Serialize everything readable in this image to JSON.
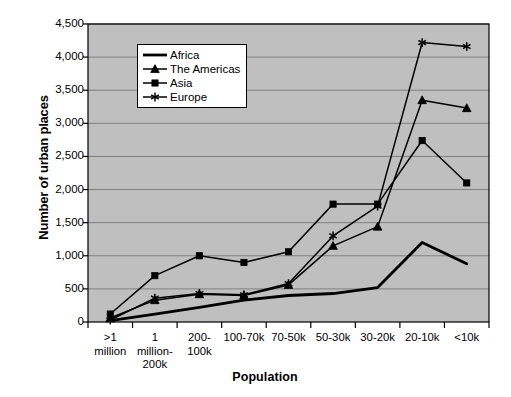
{
  "chart_data": {
    "type": "line",
    "title": "",
    "xlabel": "Population",
    "ylabel": "Number of urban places",
    "categories": [
      ">1\nmillion",
      "1\nmillion-\n200k",
      "200-\n100k",
      "100-70k",
      "70-50k",
      "50-30k",
      "30-20k",
      "20-10k",
      "<10k"
    ],
    "category_plain": [
      ">1 million",
      "1 million-200k",
      "200-100k",
      "100-70k",
      "70-50k",
      "50-30k",
      "30-20k",
      "20-10k",
      "<10k"
    ],
    "ylim": [
      0,
      4500
    ],
    "ytick_values": [
      0,
      500,
      1000,
      1500,
      2000,
      2500,
      3000,
      3500,
      4000,
      4500
    ],
    "ytick_labels": [
      "0",
      "500",
      "1,000",
      "1,500",
      "2,000",
      "2,500",
      "3,000",
      "3,500",
      "4,000",
      "4,500"
    ],
    "grid": true,
    "legend_position": "top-center",
    "plot_background": "#bfbfbf",
    "series": [
      {
        "name": "Africa",
        "marker": "none",
        "color": "#000000",
        "values": [
          20,
          120,
          220,
          330,
          400,
          430,
          520,
          1200,
          880
        ]
      },
      {
        "name": "The Americas",
        "marker": "triangle",
        "color": "#000000",
        "values": [
          60,
          330,
          420,
          400,
          560,
          1150,
          1440,
          3350,
          3230
        ]
      },
      {
        "name": "Asia",
        "marker": "square",
        "color": "#000000",
        "values": [
          120,
          700,
          1000,
          900,
          1060,
          1780,
          1780,
          2740,
          2100
        ]
      },
      {
        "name": "Europe",
        "marker": "star",
        "color": "#000000",
        "values": [
          30,
          360,
          430,
          410,
          580,
          1300,
          1750,
          4220,
          4160
        ]
      }
    ]
  },
  "legend": {
    "items": [
      {
        "label": "Africa",
        "marker": "none"
      },
      {
        "label": "The Americas",
        "marker": "triangle"
      },
      {
        "label": "Asia",
        "marker": "square"
      },
      {
        "label": "Europe",
        "marker": "star"
      }
    ]
  }
}
